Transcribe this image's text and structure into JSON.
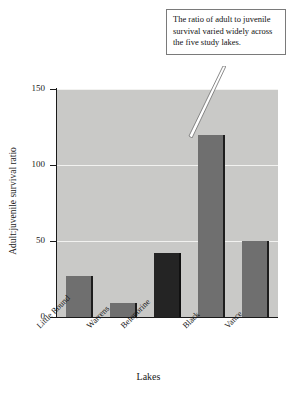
{
  "chart_data": {
    "type": "bar",
    "title": "",
    "subtitle": "",
    "xlabel": "Lakes",
    "ylabel": "Adult:juvenile survival ratio",
    "categories": [
      "Little Round",
      "Warrens",
      "Beloporine",
      "Black",
      "Vance"
    ],
    "values": [
      27,
      9,
      42,
      120,
      50
    ],
    "series": [
      {
        "name": "Adult:juvenile survival ratio",
        "values": [
          27,
          9,
          42,
          120,
          50
        ]
      }
    ],
    "ylim": [
      0,
      150
    ],
    "yticks": [
      0,
      50,
      100,
      150
    ],
    "ytick_labels": [
      "0",
      "50",
      "100",
      "150"
    ],
    "grid": true,
    "grid_axis": "y",
    "legend": false,
    "legend_position": "none",
    "bar_colors": [
      "#6f6f6f",
      "#6f6f6f",
      "#242424",
      "#6f6f6f",
      "#6f6f6f"
    ],
    "plot_background": "#c9c9c7",
    "gridline_color": "#f2f2f0",
    "axis_color": "#1a1a1a",
    "annotations": [
      {
        "text": "The ratio of adult to juvenile survival varied widely across the five study lakes.",
        "points_to": "Black",
        "style": "callout-box"
      }
    ]
  },
  "callout": {
    "text": "The ratio of adult to juvenile survival varied widely across the five study lakes."
  },
  "axes": {
    "y_title": "Adult:juvenile survival ratio",
    "x_title": "Lakes",
    "y_ticks": [
      "150",
      "100",
      "50",
      "0"
    ]
  }
}
